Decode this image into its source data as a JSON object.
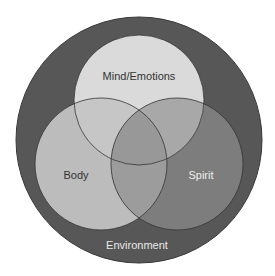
{
  "diagram": {
    "type": "venn",
    "outer": {
      "label": "Environment",
      "color": "#555555",
      "text_color": "#e8e8e8"
    },
    "circles": [
      {
        "label": "Mind/Emotions",
        "color": "#d9d9d9",
        "text_color": "#333333"
      },
      {
        "label": "Body",
        "color": "#bdbdbd",
        "text_color": "#333333"
      },
      {
        "label": "Spirit",
        "color": "#7a7a7a",
        "text_color": "#eeeeee"
      }
    ]
  }
}
